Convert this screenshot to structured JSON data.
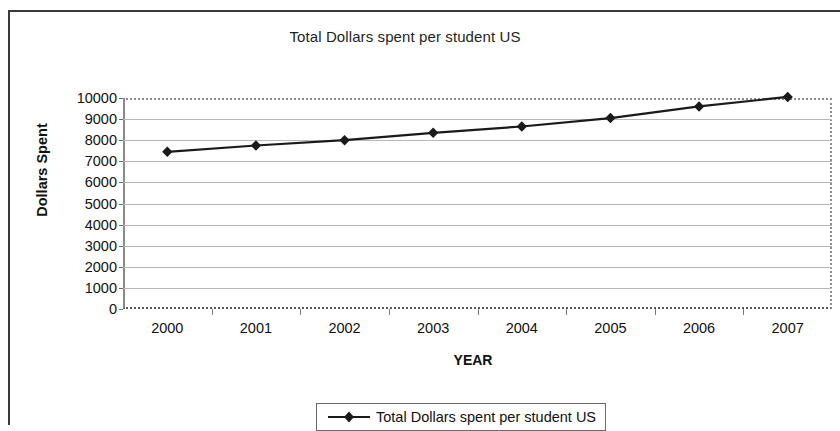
{
  "chart_data": {
    "type": "line",
    "title": "Total Dollars spent per student US",
    "xlabel": "YEAR",
    "ylabel": "Dollars Spent",
    "categories": [
      "2000",
      "2001",
      "2002",
      "2003",
      "2004",
      "2005",
      "2006",
      "2007"
    ],
    "series": [
      {
        "name": "Total Dollars spent per student US",
        "values": [
          7450,
          7750,
          8000,
          8350,
          8650,
          9050,
          9600,
          10050
        ],
        "color": "#1a1a1a",
        "marker": "diamond"
      }
    ],
    "ylim": [
      0,
      10000
    ],
    "y_ticks": [
      0,
      1000,
      2000,
      3000,
      4000,
      5000,
      6000,
      7000,
      8000,
      9000,
      10000
    ],
    "y_tick_labels": [
      "0",
      "1000",
      "2000",
      "3000",
      "4000",
      "5000",
      "6000",
      "7000",
      "8000",
      "9000",
      "10000"
    ],
    "grid": true,
    "grid_axis": "y",
    "legend_position": "bottom",
    "legend_entries": [
      "Total Dollars spent per student US"
    ]
  }
}
